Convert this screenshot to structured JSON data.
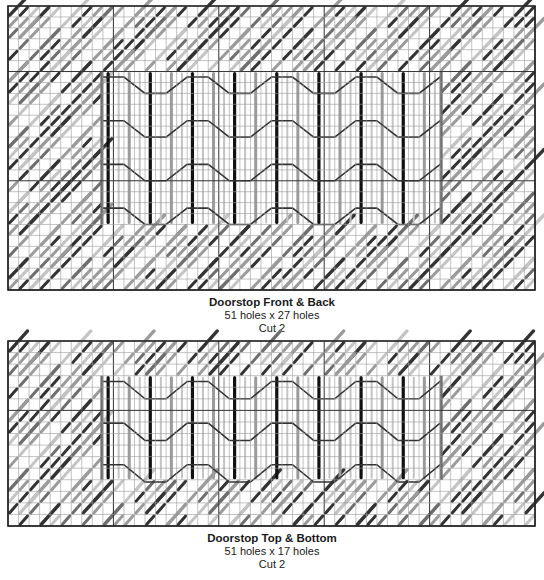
{
  "colors": {
    "grid": "#9a9a9a",
    "border": "#222222",
    "section_line": "#333333",
    "stitch_light": "#9b9b9b",
    "stitch_mid": "#6e6e6e",
    "stitch_dark": "#333333",
    "stitch_black": "#111111",
    "stitch_pale": "#c4c4c4"
  },
  "charts": [
    {
      "id": "front-back",
      "title": "Doorstop Front & Back",
      "dimensions": "51 holes x 27 holes",
      "cut": "Cut 2",
      "holes_x": 51,
      "holes_y": 27,
      "box": {
        "x": 8,
        "y": 6,
        "w": 527,
        "h": 284
      },
      "panel": {
        "col0": 9,
        "col1": 41,
        "row0": 6,
        "row1": 20
      },
      "caption_top": 296
    },
    {
      "id": "top-bottom",
      "title": "Doorstop Top & Bottom",
      "dimensions": "51 holes x 17 holes",
      "cut": "Cut 2",
      "holes_x": 51,
      "holes_y": 17,
      "box": {
        "x": 8,
        "y": 341,
        "w": 527,
        "h": 185
      },
      "panel": {
        "col0": 9,
        "col1": 41,
        "row0": 3,
        "row1": 12
      },
      "caption_top": 532
    }
  ]
}
